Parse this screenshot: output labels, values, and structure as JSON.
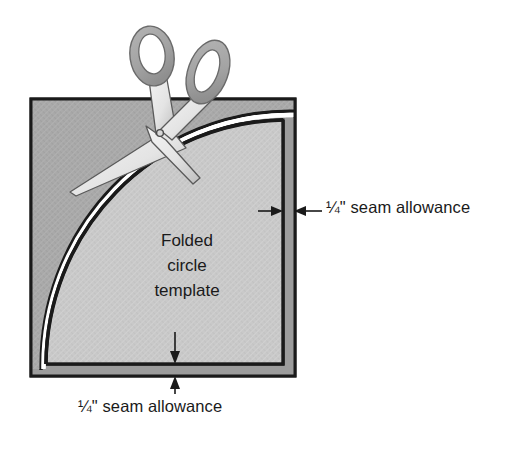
{
  "figure": {
    "kind": "sewing-instruction-diagram",
    "background_color": "#ffffff"
  },
  "labels": {
    "seam_allowance_right": "¼\" seam allowance",
    "seam_allowance_bottom": "¼\" seam allowance",
    "template_line1": "Folded",
    "template_line2": "circle",
    "template_line3": "template"
  },
  "colors": {
    "fabric_outer": "#a9a9a9",
    "fabric_outer_dark": "#9a9a9a",
    "template_fill": "#c9c9c9",
    "outline": "#1a1a1a",
    "cut_gap": "#ffffff",
    "scissor_handle": "#a3a3a3",
    "scissor_blade": "#ececec",
    "scissor_blade_shadow": "#c4c4c4",
    "text": "#1a1a1a"
  },
  "geometry": {
    "outer_square": {
      "x": 31,
      "y": 99,
      "width": 264,
      "height": 277
    },
    "template_rect": {
      "x": 46,
      "y": 118,
      "width": 237,
      "height": 246
    },
    "seam_allowance_px": 12,
    "arc_start": {
      "x": 46,
      "y": 364
    },
    "arc_end": {
      "x": 283,
      "y": 120
    }
  },
  "annotations": {
    "right_arrow_pair": {
      "y": 211,
      "left_tip_x": 272,
      "right_tip_x": 296
    },
    "bottom_arrow_pair": {
      "x": 175,
      "top_tip_y": 352,
      "bottom_tip_y": 377
    }
  },
  "scissors": {
    "present": true,
    "pivot": {
      "x": 160,
      "y": 133
    },
    "handle_left_center": {
      "x": 152,
      "y": 57
    },
    "handle_right_center": {
      "x": 207,
      "y": 72
    }
  }
}
